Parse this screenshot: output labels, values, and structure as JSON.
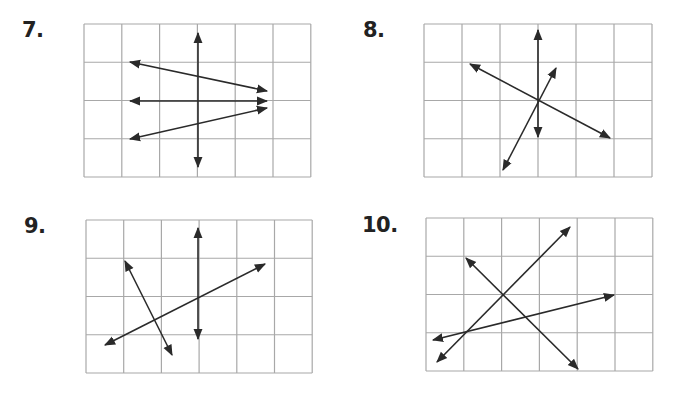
{
  "colors": {
    "grid": "#a8a8a8",
    "line": "#2a2a2a",
    "label": "#222222"
  },
  "problems": [
    {
      "number": "7.",
      "label_pos": [
        22,
        18
      ],
      "grid": {
        "x": 84,
        "y": 24,
        "cols": 6,
        "rows": 4,
        "cell_w": 37.8,
        "cell_h": 38.25
      },
      "lines": [
        {
          "x1": 198,
          "y1": 33,
          "x2": 198,
          "y2": 167
        },
        {
          "x1": 130,
          "y1": 62,
          "x2": 267,
          "y2": 91
        },
        {
          "x1": 130,
          "y1": 101,
          "x2": 267,
          "y2": 101
        },
        {
          "x1": 130,
          "y1": 139,
          "x2": 267,
          "y2": 108
        }
      ]
    },
    {
      "number": "8.",
      "label_pos": [
        363,
        18
      ],
      "grid": {
        "x": 424,
        "y": 24,
        "cols": 6,
        "rows": 4,
        "cell_w": 38,
        "cell_h": 38.25
      },
      "lines": [
        {
          "x1": 538,
          "y1": 30,
          "x2": 538,
          "y2": 137
        },
        {
          "x1": 470,
          "y1": 64,
          "x2": 610,
          "y2": 138
        },
        {
          "x1": 503,
          "y1": 170,
          "x2": 556,
          "y2": 68
        }
      ]
    },
    {
      "number": "9.",
      "label_pos": [
        24,
        214
      ],
      "grid": {
        "x": 86,
        "y": 220,
        "cols": 6,
        "rows": 4,
        "cell_w": 37.7,
        "cell_h": 38.25
      },
      "lines": [
        {
          "x1": 198,
          "y1": 228,
          "x2": 198,
          "y2": 339
        },
        {
          "x1": 105,
          "y1": 345,
          "x2": 265,
          "y2": 264
        },
        {
          "x1": 125,
          "y1": 261,
          "x2": 172,
          "y2": 355
        }
      ]
    },
    {
      "number": "10.",
      "label_pos": [
        362,
        213
      ],
      "grid": {
        "x": 426,
        "y": 218,
        "cols": 6,
        "rows": 4,
        "cell_w": 37.8,
        "cell_h": 38.25
      },
      "lines": [
        {
          "x1": 437,
          "y1": 362,
          "x2": 570,
          "y2": 227
        },
        {
          "x1": 466,
          "y1": 258,
          "x2": 578,
          "y2": 369
        },
        {
          "x1": 433,
          "y1": 340,
          "x2": 614,
          "y2": 295
        }
      ]
    }
  ]
}
